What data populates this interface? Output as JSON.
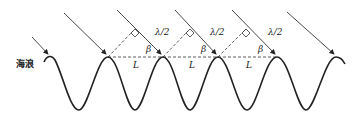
{
  "diagram": {
    "wave_label": "海浪",
    "half_wavelength_label": "λ/2",
    "angle_label": "β",
    "spacing_label": "L",
    "colors": {
      "stroke": "#222222",
      "background": "#ffffff"
    },
    "crest_x": [
      50,
      108,
      163,
      218,
      277,
      336
    ],
    "crest_y": 57,
    "trough_y": 110,
    "labels": [
      {
        "text": "λ/2",
        "x": 155,
        "y": 30
      },
      {
        "text": "λ/2",
        "x": 210,
        "y": 30
      },
      {
        "text": "λ/2",
        "x": 268,
        "y": 30
      },
      {
        "text": "β",
        "x": 145,
        "y": 48
      },
      {
        "text": "β",
        "x": 200,
        "y": 48
      },
      {
        "text": "β",
        "x": 258,
        "y": 48
      },
      {
        "text": "L",
        "x": 133,
        "y": 62
      },
      {
        "text": "L",
        "x": 190,
        "y": 62
      },
      {
        "text": "L",
        "x": 247,
        "y": 62
      }
    ]
  }
}
